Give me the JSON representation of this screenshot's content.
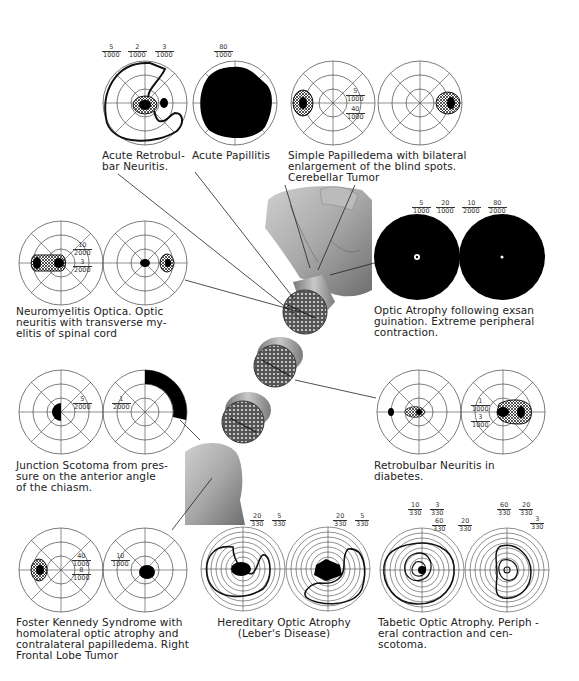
{
  "figure": {
    "type": "medical-illustration",
    "center_image": "optic-nerve-specimen-cross-sections"
  },
  "panels": [
    {
      "id": "acute-retrobulbar-neuritis",
      "caption_lines": [
        "Acute Retrobul-",
        "bar Neuritis."
      ],
      "isopters": [
        {
          "num": "5",
          "den": "1000"
        },
        {
          "num": "2",
          "den": "1000"
        },
        {
          "num": "3",
          "den": "1000"
        }
      ]
    },
    {
      "id": "acute-papillitis",
      "caption_lines": [
        "Acute Papillitis"
      ],
      "isopters": [
        {
          "num": "80",
          "den": "1000"
        }
      ]
    },
    {
      "id": "simple-papilledema",
      "caption_lines": [
        "Simple Papilledema with bilateral",
        "enlargement of the blind spots.",
        "Cerebellar Tumor"
      ],
      "isopters": [
        {
          "num": "5",
          "den": "1000"
        },
        {
          "num": "40",
          "den": "1000"
        }
      ]
    },
    {
      "id": "optic-atrophy-exsanguination",
      "caption_lines": [
        "Optic Atrophy following exsan",
        "guination. Extreme peripheral",
        "contraction."
      ],
      "isopters": [
        {
          "num": "5",
          "den": "1000"
        },
        {
          "num": "20",
          "den": "1000"
        },
        {
          "num": "10",
          "den": "2000"
        },
        {
          "num": "80",
          "den": "2000"
        }
      ]
    },
    {
      "id": "neuromyelitis-optica",
      "caption_lines": [
        "Neuromyelitis Optica. Optic",
        "neuritis with transverse my-",
        "elitis of spinal cord"
      ],
      "isopters": [
        {
          "num": "10",
          "den": "2000"
        },
        {
          "num": "3",
          "den": "2000"
        }
      ]
    },
    {
      "id": "junction-scotoma",
      "caption_lines": [
        "Junction Scotoma from pres-",
        "sure on the anterior angle",
        "of the chiasm."
      ],
      "isopters": [
        {
          "num": "5",
          "den": "2000"
        },
        {
          "num": "1",
          "den": "2000"
        }
      ]
    },
    {
      "id": "retrobulbar-neuritis-diabetes",
      "caption_lines": [
        "Retrobulbar   Neuritis   in",
        "diabetes."
      ],
      "isopters": [
        {
          "num": "1",
          "den": "1000"
        },
        {
          "num": "3",
          "den": "1000"
        }
      ]
    },
    {
      "id": "foster-kennedy",
      "caption_lines": [
        "Foster Kennedy Syndrome with",
        "homolateral optic atrophy and",
        "contralateral papilledema. Right",
        "Frontal Lobe Tumor"
      ],
      "isopters": [
        {
          "num": "40",
          "den": "1000"
        },
        {
          "num": "8",
          "den": "1000"
        },
        {
          "num": "10",
          "den": "1000"
        }
      ]
    },
    {
      "id": "hereditary-optic-atrophy",
      "caption_lines": [
        "Hereditary Optic Atrophy",
        "(Leber's Disease)"
      ],
      "isopters": [
        {
          "num": "20",
          "den": "330"
        },
        {
          "num": "5",
          "den": "330"
        },
        {
          "num": "20",
          "den": "330"
        },
        {
          "num": "5",
          "den": "330"
        }
      ]
    },
    {
      "id": "tabetic-optic-atrophy",
      "caption_lines": [
        "Tabetic Optic Atrophy. Periph -",
        "eral contraction and cen-",
        "scotoma."
      ],
      "isopters": [
        {
          "num": "10",
          "den": "330"
        },
        {
          "num": "3",
          "den": "330"
        },
        {
          "num": "60",
          "den": "330"
        },
        {
          "num": "20",
          "den": "330"
        },
        {
          "num": "60",
          "den": "330"
        },
        {
          "num": "20",
          "den": "330"
        },
        {
          "num": "3",
          "den": "330"
        }
      ]
    }
  ]
}
